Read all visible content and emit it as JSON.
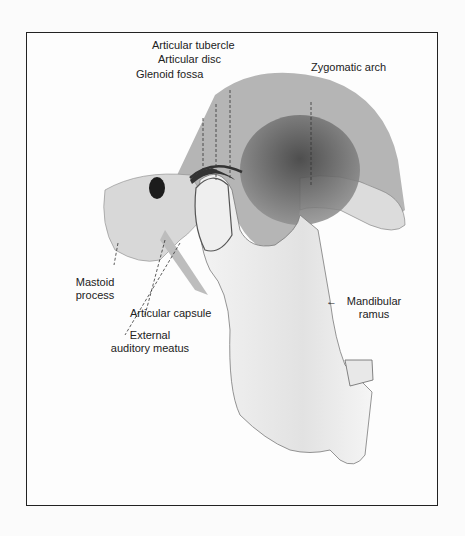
{
  "figure": {
    "labels": {
      "articular_tubercle": "Articular tubercle",
      "articular_disc": "Articular disc",
      "glenoid_fossa": "Glenoid fossa",
      "zygomatic_arch": "Zygomatic arch",
      "mastoid_process_1": "Mastoid",
      "mastoid_process_2": "process",
      "articular_capsule": "Articular capsule",
      "external_meatus_1": "External",
      "external_meatus_2": "auditory meatus",
      "mandibular_ramus_arrow": "←",
      "mandibular_ramus_1": "Mandibular",
      "mandibular_ramus_2": "ramus"
    },
    "colors": {
      "frame": "#222222",
      "bone_light": "#ececec",
      "bone_shade": "#8a8a8a",
      "shadow": "#3a3a3a"
    }
  }
}
